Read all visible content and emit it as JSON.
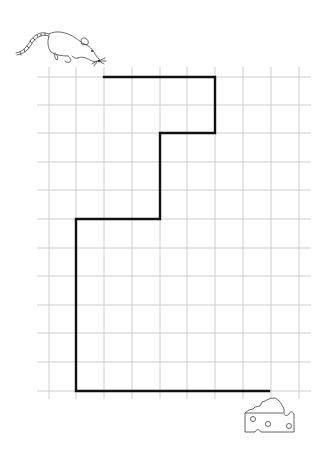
{
  "puzzle": {
    "title": "",
    "grid": {
      "x_lines": [
        49,
        76,
        104,
        132,
        160,
        187,
        215,
        243,
        271,
        299
      ],
      "y_lines": [
        77,
        105,
        133,
        162,
        190,
        219,
        248,
        276,
        305,
        333,
        362,
        391
      ],
      "h_extent": [
        37,
        311
      ],
      "v_extent": [
        67,
        399
      ],
      "line_color": "#c8c8c8"
    },
    "path": {
      "points": [
        [
          104,
          77
        ],
        [
          215,
          77
        ],
        [
          215,
          133
        ],
        [
          160,
          133
        ],
        [
          160,
          219
        ],
        [
          76,
          219
        ],
        [
          76,
          391
        ],
        [
          269,
          391
        ]
      ],
      "color": "#111111",
      "width": 2.4
    },
    "start": {
      "label": "mouse",
      "icon": "mouse-icon"
    },
    "goal": {
      "label": "cheese",
      "icon": "cheese-icon"
    }
  }
}
